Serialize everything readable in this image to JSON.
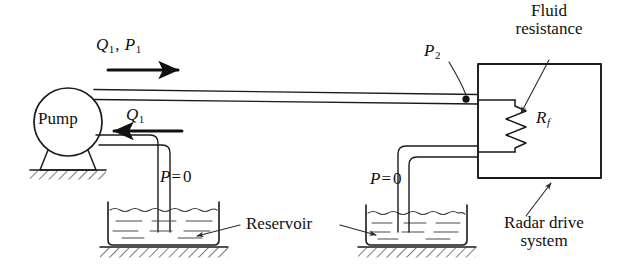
{
  "figure": {
    "stroke_color": "#1a1a1a",
    "background_color": "#ffffff",
    "hatch_color": "#2b2b2b",
    "water_color": "#3a3a3a"
  },
  "labels": {
    "pump": "Pump",
    "flow_pressure_out": {
      "q": "Q",
      "q_sub": "1",
      "sep": ", ",
      "p": "P",
      "p_sub": "1"
    },
    "flow_in": {
      "q": "Q",
      "q_sub": "1"
    },
    "pressure_two": {
      "p": "P",
      "p_sub": "2"
    },
    "resistance_symbol": {
      "r": "R",
      "r_sub": "f"
    },
    "fluid_resistance_line1": "Fluid",
    "fluid_resistance_line2": "resistance",
    "radar_line1": "Radar drive",
    "radar_line2": "system",
    "reservoir": "Reservoir",
    "pressure_zero_left": {
      "p": "P",
      "eq": "=",
      "val": "0"
    },
    "pressure_zero_right": {
      "p": "P",
      "eq": "=",
      "val": "0"
    }
  },
  "components": {
    "pump_body": "pump-circle",
    "pump_base": "pump-pedestal",
    "delivery_pipe": "delivery-pipe-q1-p1",
    "suction_pipe": "suction-pipe-q1",
    "return_pipe": "return-pipe",
    "left_tank": "reservoir-left",
    "right_tank": "reservoir-right",
    "load_box": "radar-drive-system-box",
    "resistor": "fluid-resistance-zigzag",
    "pressure_tap": "pressure-tap-p2"
  }
}
